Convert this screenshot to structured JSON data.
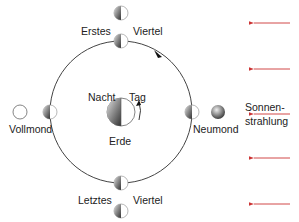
{
  "diagram": {
    "labels": {
      "erstes": "Erstes",
      "viertel_top": "Viertel",
      "letztes": "Letztes",
      "viertel_bottom": "Viertel",
      "vollmond": "Vollmond",
      "neumond": "Neumond",
      "nacht": "Nacht",
      "tag": "Tag",
      "erde": "Erde",
      "sonnen": "Sonnen-",
      "strahlung": "strahlung"
    },
    "colors": {
      "orbit": "#444444",
      "sun_rays": "#cc3333",
      "text": "#222222"
    },
    "sun_ray_count": 5
  }
}
